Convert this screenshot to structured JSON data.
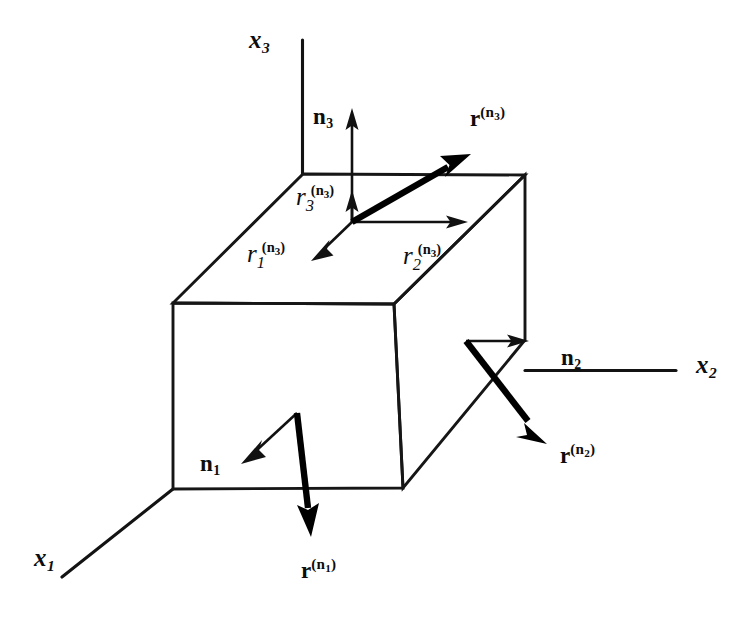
{
  "figure": {
    "background_color": "#ffffff",
    "ink_color": "#000000"
  },
  "axes": [
    {
      "name": "x3",
      "label_main": "x",
      "label_sub": "3",
      "description": "vertical axis pointing up"
    },
    {
      "name": "x2",
      "label_main": "x",
      "label_sub": "2",
      "description": "horizontal axis pointing right"
    },
    {
      "name": "x1",
      "label_main": "x",
      "label_sub": "1",
      "description": "oblique axis pointing down-left toward viewer"
    }
  ],
  "normals": [
    {
      "name": "n1",
      "label_main": "n",
      "label_sub": "1",
      "face": "front face (x1 normal)",
      "direction": "down-left"
    },
    {
      "name": "n2",
      "label_main": "n",
      "label_sub": "2",
      "face": "right face (x2 normal)",
      "direction": "right"
    },
    {
      "name": "n3",
      "label_main": "n",
      "label_sub": "3",
      "face": "top face (x3 normal)",
      "direction": "up"
    }
  ],
  "tractions": [
    {
      "name": "r_n1",
      "label_main": "r",
      "label_sup_open": "(",
      "label_sup_main": "n",
      "label_sup_sub": "1",
      "label_sup_close": ")",
      "face": "front face",
      "direction": "down"
    },
    {
      "name": "r_n2",
      "label_main": "r",
      "label_sup_open": "(",
      "label_sup_main": "n",
      "label_sup_sub": "2",
      "label_sup_close": ")",
      "face": "right face",
      "direction": "down-right"
    },
    {
      "name": "r_n3",
      "label_main": "r",
      "label_sup_open": "(",
      "label_sup_main": "n",
      "label_sup_sub": "3",
      "label_sup_close": ")",
      "face": "top face",
      "direction": "up-right"
    }
  ],
  "components": [
    {
      "name": "r1_n3",
      "label_main": "r",
      "label_sub": "1",
      "label_sup_open": "(",
      "label_sup_main": "n",
      "label_sup_sub": "3",
      "label_sup_close": ")",
      "direction": "down-left",
      "description": "x1 component of traction on top face"
    },
    {
      "name": "r2_n3",
      "label_main": "r",
      "label_sub": "2",
      "label_sup_open": "(",
      "label_sup_main": "n",
      "label_sup_sub": "3",
      "label_sup_close": ")",
      "direction": "right",
      "description": "x2 component of traction on top face"
    },
    {
      "name": "r3_n3",
      "label_main": "r",
      "label_sub": "3",
      "label_sup_open": "(",
      "label_sup_main": "n",
      "label_sup_sub": "3",
      "label_sup_close": ")",
      "direction": "up",
      "description": "x3 component of traction on top face"
    }
  ]
}
